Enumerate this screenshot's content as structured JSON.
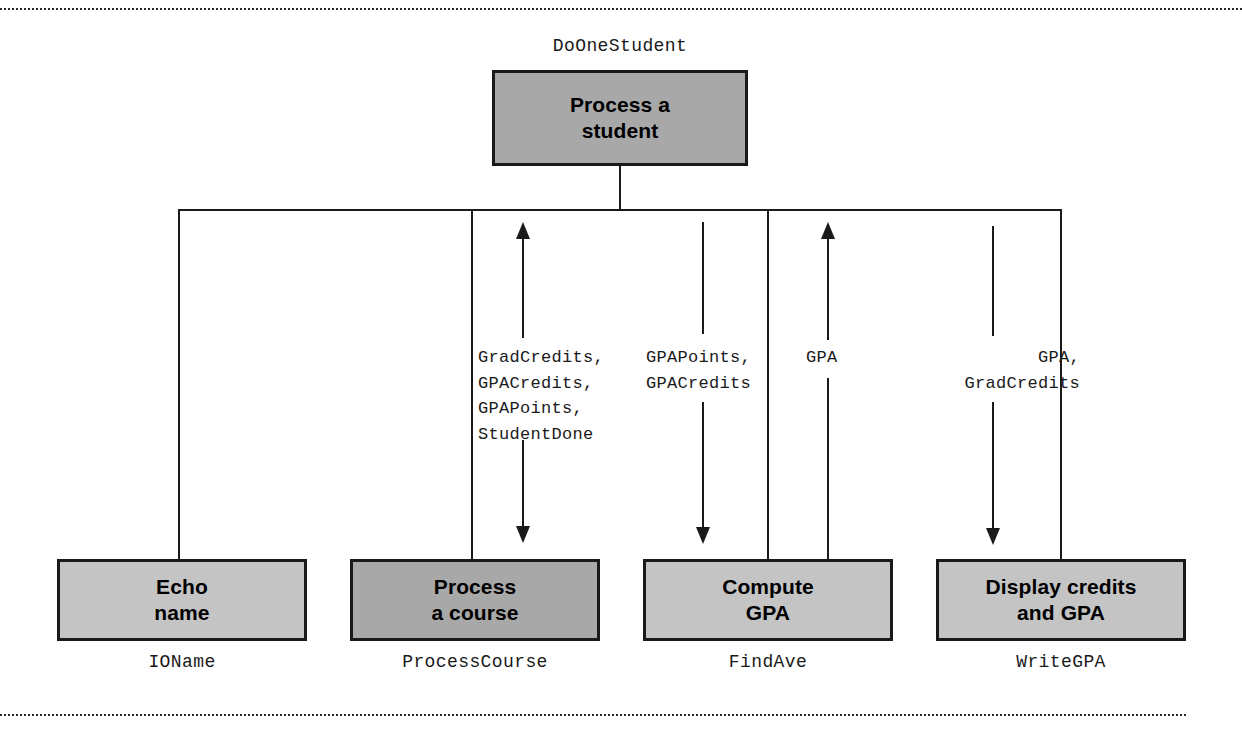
{
  "diagram": {
    "type": "structure-chart",
    "root": {
      "title": "Process a\nstudent",
      "title_line1": "Process a",
      "title_line2": "student",
      "module_name": "DoOneStudent",
      "fill": "#a8a8a8"
    },
    "children": [
      {
        "title_line1": "Echo",
        "title_line2": "name",
        "module_name": "IOName",
        "fill": "#c4c4c4",
        "couples": []
      },
      {
        "title_line1": "Process",
        "title_line2": "a course",
        "module_name": "ProcessCourse",
        "fill": "#a8a8a8",
        "couples": [
          {
            "direction": "up",
            "label": "GradCredits,\nGPACredits,\nGPAPoints,\nStudentDone"
          },
          {
            "direction": "down",
            "label": ""
          }
        ]
      },
      {
        "title_line1": "Compute",
        "title_line2": "GPA",
        "module_name": "FindAve",
        "fill": "#c4c4c4",
        "couples": [
          {
            "direction": "down",
            "label": "GPAPoints,\nGPACredits"
          },
          {
            "direction": "up",
            "label": "GPA"
          }
        ]
      },
      {
        "title_line1": "Display credits",
        "title_line2": "and GPA",
        "module_name": "WriteGPA",
        "fill": "#c4c4c4",
        "couples": [
          {
            "direction": "down",
            "label": "GPA,\nGradCredits"
          }
        ]
      }
    ],
    "couple_labels": {
      "process_course_in": "GradCredits,\nGPACredits,\nGPAPoints,\nStudentDone",
      "find_ave_in": "GPAPoints,\nGPACredits",
      "find_ave_out": "GPA",
      "write_gpa_in": "GPA,\nGradCredits"
    },
    "colors": {
      "line": "#1a1a1a",
      "fill_light": "#c4c4c4",
      "fill_dark": "#a8a8a8",
      "background": "#ffffff",
      "rule": "#2a2a2a"
    }
  }
}
